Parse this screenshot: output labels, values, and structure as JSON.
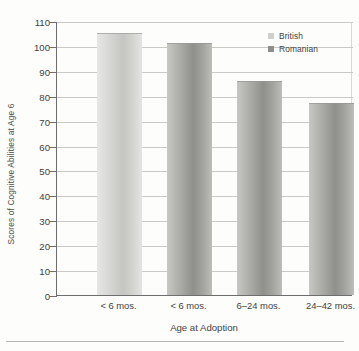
{
  "chart_data": {
    "type": "bar",
    "title": "",
    "xlabel": "Age at Adoption",
    "ylabel": "Scores of Cognitive Abilities at Age 6",
    "categories": [
      "< 6 mos.",
      "< 6 mos.",
      "6–24 mos.",
      "24–42 mos."
    ],
    "values": [
      105,
      101,
      86,
      77
    ],
    "series": [
      {
        "name": "British",
        "values": [
          105,
          null,
          null,
          null
        ]
      },
      {
        "name": "Romanian",
        "values": [
          null,
          101,
          86,
          77
        ]
      }
    ],
    "bar_groups": [
      {
        "category": "< 6 mos.",
        "series": "British",
        "value": 105
      },
      {
        "category": "< 6 mos.",
        "series": "Romanian",
        "value": 101
      },
      {
        "category": "6–24 mos.",
        "series": "Romanian",
        "value": 86
      },
      {
        "category": "24–42 mos.",
        "series": "Romanian",
        "value": 77
      }
    ],
    "ylim": [
      0,
      110
    ],
    "ytick_step": 10,
    "yticks": [
      0,
      10,
      20,
      30,
      40,
      50,
      60,
      70,
      80,
      90,
      100,
      110
    ],
    "ytick_labels": [
      "0",
      "10",
      "20",
      "30",
      "40",
      "50",
      "60",
      "70",
      "80",
      "90",
      "100",
      "110"
    ],
    "grid": true,
    "legend_position": "top-right",
    "colors": {
      "british": "#cfcfcc",
      "romanian": "#8e8e8a",
      "axis": "#6e6e6e",
      "gridline": "#c9c9c6",
      "text": "#3f3f3f",
      "background": "#fdfdfb"
    }
  },
  "legend": {
    "items": [
      {
        "label": "British",
        "key": "british"
      },
      {
        "label": "Romanian",
        "key": "romanian"
      }
    ]
  }
}
